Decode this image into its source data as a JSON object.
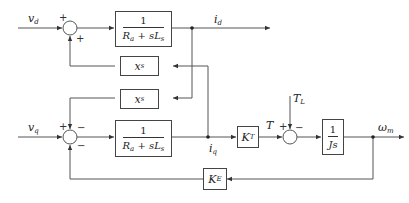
{
  "diagram": {
    "type": "control block diagram",
    "inputs": {
      "vd": "v",
      "vd_sub": "d",
      "vq": "v",
      "vq_sub": "q",
      "TL": "T",
      "TL_sub": "L"
    },
    "outputs": {
      "id": "i",
      "id_sub": "d",
      "iq": "i",
      "iq_sub": "q",
      "wm": "ω",
      "wm_sub": "m",
      "T": "T"
    },
    "blocks": {
      "d_plant": {
        "num": "1",
        "den_a": "R",
        "den_a_sub": "a",
        "den_b": " + sL",
        "den_b_sub": "s"
      },
      "q_plant": {
        "num": "1",
        "den_a": "R",
        "den_a_sub": "a",
        "den_b": " + sL",
        "den_b_sub": "s"
      },
      "xs_top": {
        "main": "x",
        "sub": "s"
      },
      "xs_bottom": {
        "main": "x",
        "sub": "s"
      },
      "KT": {
        "main": "K",
        "sub": "T"
      },
      "KE": {
        "main": "K",
        "sub": "E"
      },
      "mech": {
        "num": "1",
        "den": "Js"
      }
    },
    "signs": {
      "sum1_left": "+",
      "sum1_bottom": "+",
      "sum2_left": "+",
      "sum2_top": "−",
      "sum2_bottom": "−",
      "sum3_left": "+",
      "sum3_top": "−"
    },
    "colors": {
      "line": "#444444",
      "background": "#ffffff"
    }
  }
}
